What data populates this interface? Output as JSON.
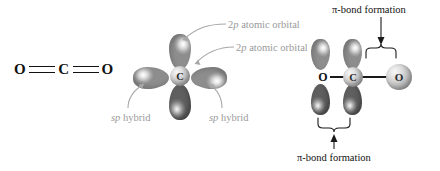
{
  "figure": {
    "caption_domain": "chemistry-orbital-diagram",
    "panels": [
      {
        "id": "lewis",
        "name": "lewis-structure"
      },
      {
        "id": "hybrid",
        "name": "sp-hybrid-orbital-diagram"
      },
      {
        "id": "pibond",
        "name": "pi-bond-formation-diagram"
      }
    ]
  },
  "lewis": {
    "left_atom": "O",
    "center_atom": "C",
    "right_atom": "O",
    "bond_type": "double"
  },
  "hybrid": {
    "center_atom": "C",
    "labels": {
      "p_orbital_top": {
        "prefix": "2",
        "italic": "p",
        "suffix": " atomic orbital"
      },
      "p_orbital_bottom": {
        "prefix": "2",
        "italic": "p",
        "suffix": " atomic orbital"
      },
      "sp_hybrid_left": {
        "italic": "sp",
        "suffix": " hybrid"
      },
      "sp_hybrid_right": {
        "italic": "sp",
        "suffix": " hybrid"
      }
    },
    "lobes": [
      {
        "name": "p-orbital-lobe-up",
        "shade": "light"
      },
      {
        "name": "p-orbital-lobe-down",
        "shade": "dark"
      },
      {
        "name": "sp-hybrid-lobe-left",
        "shade": "light"
      },
      {
        "name": "sp-hybrid-lobe-right",
        "shade": "light"
      }
    ]
  },
  "pibond": {
    "atoms": {
      "left_oxygen": "O",
      "carbon": "C",
      "right_oxygen": "O"
    },
    "top_label": "π-bond formation",
    "bottom_label": "π-bond formation"
  },
  "colors": {
    "text": "#111111",
    "label_gray": "#9a9a9a",
    "lobe_light": "#c9c9c9",
    "lobe_dark": "#7b7b7b",
    "bond": "#1a1a1a"
  }
}
